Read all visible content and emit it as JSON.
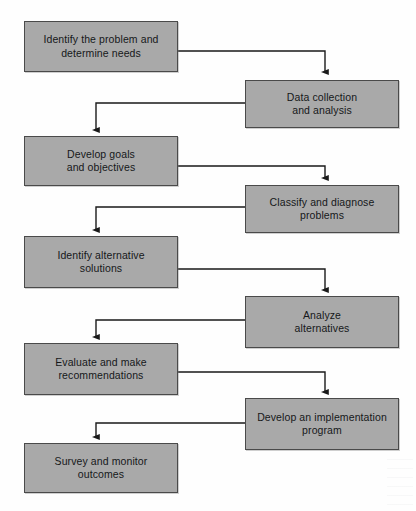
{
  "diagram": {
    "colors": {
      "node_fill": "#a9a9a9",
      "node_border": "#4a4a4a",
      "connector": "#1a1a1a",
      "text": "#16181a",
      "background": "#fefefe"
    },
    "nodes": [
      {
        "id": "identify-problem",
        "label": "Identify the problem and\ndetermine needs",
        "column": "left",
        "x": 24,
        "y": 21,
        "w": 154,
        "h": 51
      },
      {
        "id": "data-collection",
        "label": "Data collection\nand analysis",
        "column": "right",
        "x": 245,
        "y": 80,
        "w": 154,
        "h": 48
      },
      {
        "id": "develop-goals",
        "label": "Develop goals\nand objectives",
        "column": "left",
        "x": 24,
        "y": 136,
        "w": 154,
        "h": 50
      },
      {
        "id": "classify-diagnose",
        "label": "Classify and diagnose\nproblems",
        "column": "right",
        "x": 245,
        "y": 185,
        "w": 154,
        "h": 48
      },
      {
        "id": "identify-alternatives",
        "label": "Identify alternative\nsolutions",
        "column": "left",
        "x": 24,
        "y": 236,
        "w": 154,
        "h": 52
      },
      {
        "id": "analyze-alternatives",
        "label": "Analyze\nalternatives",
        "column": "right",
        "x": 245,
        "y": 296,
        "w": 154,
        "h": 52
      },
      {
        "id": "evaluate-recommend",
        "label": "Evaluate and make\nrecommendations",
        "column": "left",
        "x": 24,
        "y": 343,
        "w": 154,
        "h": 52
      },
      {
        "id": "develop-implementation",
        "label": "Develop an implementation\nprogram",
        "column": "right",
        "x": 245,
        "y": 398,
        "w": 154,
        "h": 52
      },
      {
        "id": "survey-monitor",
        "label": "Survey and monitor\noutcomes",
        "column": "left",
        "x": 24,
        "y": 443,
        "w": 154,
        "h": 50
      }
    ],
    "connectors": [
      {
        "id": "c1",
        "from": "identify-problem",
        "to": "data-collection",
        "direction": "left-to-right",
        "path": "M178,51 L325,51 L325,72"
      },
      {
        "id": "c2",
        "from": "data-collection",
        "to": "develop-goals",
        "direction": "right-to-left",
        "path": "M245,103 L96,103 L96,130"
      },
      {
        "id": "c3",
        "from": "develop-goals",
        "to": "classify-diagnose",
        "direction": "left-to-right",
        "path": "M178,166 L325,166 L325,178"
      },
      {
        "id": "c4",
        "from": "classify-diagnose",
        "to": "identify-alternatives",
        "direction": "right-to-left",
        "path": "M245,207 L96,207 L96,230"
      },
      {
        "id": "c5",
        "from": "identify-alternatives",
        "to": "analyze-alternatives",
        "direction": "left-to-right",
        "path": "M178,269 L325,269 L325,290"
      },
      {
        "id": "c6",
        "from": "analyze-alternatives",
        "to": "evaluate-recommend",
        "direction": "right-to-left",
        "path": "M245,320 L96,320 L96,337"
      },
      {
        "id": "c7",
        "from": "evaluate-recommend",
        "to": "develop-implementation",
        "direction": "left-to-right",
        "path": "M178,372 L325,372 L325,392"
      },
      {
        "id": "c8",
        "from": "develop-implementation",
        "to": "survey-monitor",
        "direction": "right-to-left",
        "path": "M245,423 L96,423 L96,437"
      }
    ]
  }
}
